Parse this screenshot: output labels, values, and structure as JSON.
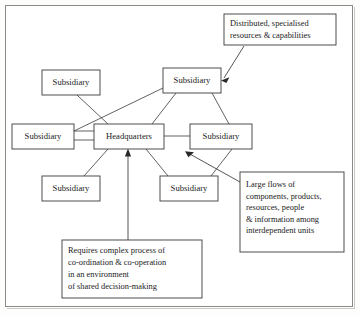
{
  "figure": {
    "background_color": "#ffffff",
    "line_color": "#3a3a3a",
    "frame_color": "#8a8a8a"
  },
  "nodes": [
    {
      "id": "sub-top-left",
      "label": "Subsidiary",
      "x": 42,
      "y": 70,
      "w": 58,
      "h": 25
    },
    {
      "id": "sub-top-mid",
      "label": "Subsidiary",
      "x": 163,
      "y": 68,
      "w": 58,
      "h": 25
    },
    {
      "id": "sub-left",
      "label": "Subsidiary",
      "x": 12,
      "y": 124,
      "w": 62,
      "h": 25
    },
    {
      "id": "headquarters",
      "label": "Headquarters",
      "x": 94,
      "y": 124,
      "w": 70,
      "h": 25
    },
    {
      "id": "sub-right",
      "label": "Subsidiary",
      "x": 190,
      "y": 124,
      "w": 62,
      "h": 25
    },
    {
      "id": "sub-bottom-left",
      "label": "Subsidiary",
      "x": 42,
      "y": 176,
      "w": 58,
      "h": 25
    },
    {
      "id": "sub-bottom-mid",
      "label": "Subsidiary",
      "x": 160,
      "y": 176,
      "w": 58,
      "h": 25
    }
  ],
  "links": [
    {
      "from": "sub-top-left",
      "to": "headquarters"
    },
    {
      "from": "sub-top-mid",
      "to": "headquarters"
    },
    {
      "from": "sub-top-mid",
      "to": "sub-left"
    },
    {
      "from": "sub-top-mid",
      "to": "sub-right"
    },
    {
      "from": "sub-left",
      "to": "headquarters"
    },
    {
      "from": "headquarters",
      "to": "sub-right"
    },
    {
      "from": "headquarters",
      "to": "sub-bottom-left"
    },
    {
      "from": "headquarters",
      "to": "sub-bottom-mid"
    },
    {
      "from": "sub-right",
      "to": "sub-bottom-mid"
    }
  ],
  "callouts": [
    {
      "id": "callout-distributed",
      "lines": [
        "Distributed, specialised",
        "resources & capabilities"
      ],
      "x": 224,
      "y": 14,
      "w": 112,
      "h": 31,
      "arrow_to": "sub-top-mid"
    },
    {
      "id": "callout-large-flows",
      "lines": [
        "Large flows of",
        "components, products,",
        "resources, people",
        "& information among",
        "interdependent units"
      ],
      "x": 240,
      "y": 172,
      "w": 104,
      "h": 80,
      "arrow_to": "headquarters-sub-right-link"
    },
    {
      "id": "callout-requires",
      "lines": [
        "Requires complex process of",
        "co-ordination & co-operation",
        "in an environment",
        "of shared decision-making"
      ],
      "x": 62,
      "y": 240,
      "w": 140,
      "h": 58,
      "arrow_to": "headquarters"
    }
  ]
}
